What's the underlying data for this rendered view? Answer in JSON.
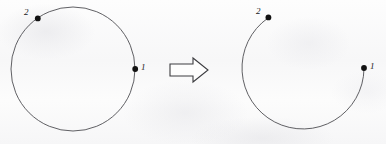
{
  "figure": {
    "caption": "",
    "background_color": "#fbfbfb",
    "stroke_color": "#4e4e52",
    "dot_color": "#121212",
    "panels": [
      {
        "id": "left-panel",
        "name": "closed-circle",
        "shape_type": "closed-circle",
        "center": [
          73,
          69
        ],
        "radius": 62,
        "points": [
          {
            "label": "1",
            "x": 135,
            "y": 69,
            "angle_deg": 0,
            "label_x": 141,
            "label_y": 64
          },
          {
            "label": "2",
            "x": 37,
            "y": 19,
            "angle_deg": 142,
            "label_x": 24,
            "label_y": 9
          }
        ]
      },
      {
        "id": "right-panel",
        "name": "open-arc",
        "shape_type": "open-arc",
        "center": [
          303,
          69
        ],
        "radius": 61,
        "arc_start_point": "1",
        "arc_end_point": "2",
        "arc_sweep": "clockwise-through-bottom",
        "gap_location": "top-right",
        "points": [
          {
            "label": "1",
            "x": 364,
            "y": 68,
            "angle_deg": 1,
            "label_x": 370,
            "label_y": 63
          },
          {
            "label": "2",
            "x": 268,
            "y": 17,
            "angle_deg": 125,
            "label_x": 256,
            "label_y": 8
          }
        ]
      }
    ],
    "arrow": {
      "name": "transformation-arrow",
      "direction": "right",
      "style": "hollow-block-arrow",
      "x": 170,
      "y": 58,
      "width": 38,
      "height": 24
    }
  }
}
